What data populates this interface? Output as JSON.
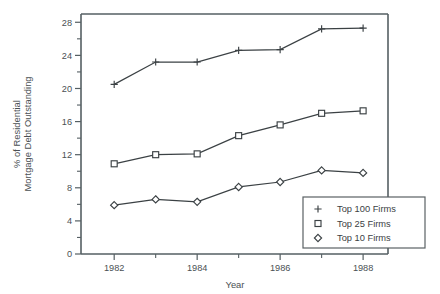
{
  "chart_data": {
    "type": "line",
    "title": "",
    "xlabel": "Year",
    "ylabel": "% of Residential Mortgage Debt Outstanding",
    "ylabel_line1": "% of Residential",
    "ylabel_line2": "Mortgage Debt Outstanding",
    "x": [
      1982,
      1983,
      1984,
      1985,
      1986,
      1987,
      1988
    ],
    "xlim": [
      1981.2,
      1988.6
    ],
    "ylim": [
      0,
      29
    ],
    "xtick_labels": [
      "1982",
      "1984",
      "1986",
      "1988"
    ],
    "xtick_values": [
      1982,
      1984,
      1986,
      1988
    ],
    "xtick_minor_values": [
      1983,
      1985,
      1987
    ],
    "ytick_labels": [
      "0",
      "4",
      "8",
      "12",
      "16",
      "20",
      "24",
      "28"
    ],
    "ytick_values": [
      0,
      4,
      8,
      12,
      16,
      20,
      24,
      28
    ],
    "ytick_minor_values": [
      2,
      6,
      10,
      14,
      18,
      22,
      26
    ],
    "grid": false,
    "legend_position": "lower right",
    "series": [
      {
        "name": "Top 100 Firms",
        "marker": "plus",
        "color": "#3b4144",
        "values": [
          20.5,
          23.2,
          23.2,
          24.6,
          24.7,
          27.2,
          27.3
        ]
      },
      {
        "name": "Top 25 Firms",
        "marker": "square",
        "color": "#3b4144",
        "values": [
          10.9,
          12.0,
          12.1,
          14.3,
          15.6,
          17.0,
          17.3
        ]
      },
      {
        "name": "Top 10 Firms",
        "marker": "diamond",
        "color": "#3b4144",
        "values": [
          5.9,
          6.6,
          6.3,
          8.1,
          8.7,
          10.1,
          9.8
        ]
      }
    ]
  },
  "legend": {
    "entries": [
      {
        "label": "Top 100 Firms",
        "marker": "plus"
      },
      {
        "label": "Top 25 Firms",
        "marker": "square"
      },
      {
        "label": "Top 10 Firms",
        "marker": "diamond"
      }
    ]
  },
  "colors": {
    "ink": "#3b4144",
    "axis": "#555f63",
    "background": "#ffffff"
  }
}
